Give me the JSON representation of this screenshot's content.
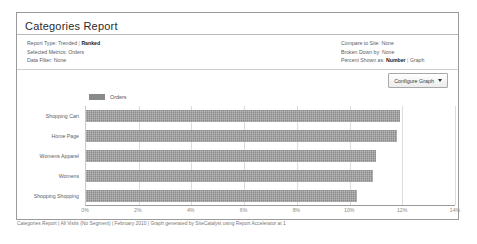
{
  "report": {
    "title": "Categories Report",
    "meta_left": [
      {
        "key": "Report Type:",
        "value_a": "Trended",
        "sep": "|",
        "value_b": "Ranked",
        "bold": "b"
      },
      {
        "key": "Selected Metrics:",
        "value_a": "Orders",
        "sep": "",
        "value_b": "",
        "bold": "none"
      },
      {
        "key": "Data Filter:",
        "value_a": "None",
        "sep": "",
        "value_b": "",
        "bold": "none"
      }
    ],
    "meta_right": [
      {
        "key": "Compare to Site:",
        "value_a": "None",
        "sep": "",
        "value_b": "",
        "bold": "none"
      },
      {
        "key": "Broken Down by:",
        "value_a": "None",
        "sep": "",
        "value_b": "",
        "bold": "none"
      },
      {
        "key": "Percent Shown as:",
        "value_a": "Number",
        "sep": "|",
        "value_b": "Graph",
        "bold": "a"
      }
    ],
    "configure_button": "Configure Graph",
    "footer": "Categories Report | All Visits (No Segment) | February 2010 | Graph generated by SiteCatalyst using Report Accelerator at 1"
  },
  "chart_data": {
    "type": "bar",
    "orientation": "horizontal",
    "title": "",
    "xlabel": "",
    "ylabel": "",
    "legend": [
      "Orders"
    ],
    "legend_position": "top-left",
    "grid": true,
    "xlim": [
      0,
      14
    ],
    "xticks": [
      "0%",
      "2%",
      "4%",
      "6%",
      "8%",
      "10%",
      "12%",
      "14%"
    ],
    "xtick_values": [
      0,
      2,
      4,
      6,
      8,
      10,
      12,
      14
    ],
    "categories": [
      "Shopping Cart",
      "Home Page",
      "Womens Apparel",
      "Womens",
      "Shopping Shopping"
    ],
    "series": [
      {
        "name": "Orders",
        "color": "#8b8b8b",
        "values": [
          11.9,
          11.8,
          11.0,
          10.9,
          10.3
        ]
      }
    ]
  }
}
